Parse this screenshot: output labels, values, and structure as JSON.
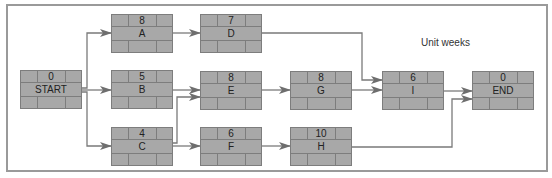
{
  "diagram": {
    "type": "activity-on-node network",
    "unit_label": "Unit weeks",
    "colors": {
      "node_fill": "#a8a8a8",
      "node_border": "#7d7d7d",
      "edge": "#7a7a7a",
      "frame": "#9a9a9a"
    },
    "nodes": [
      {
        "id": "START",
        "label": "START",
        "duration": "0",
        "x": 20,
        "y": 70
      },
      {
        "id": "A",
        "label": "A",
        "duration": "8",
        "x": 111,
        "y": 14
      },
      {
        "id": "B",
        "label": "B",
        "duration": "5",
        "x": 111,
        "y": 70
      },
      {
        "id": "C",
        "label": "C",
        "duration": "4",
        "x": 111,
        "y": 127
      },
      {
        "id": "D",
        "label": "D",
        "duration": "7",
        "x": 200,
        "y": 14
      },
      {
        "id": "E",
        "label": "E",
        "duration": "8",
        "x": 200,
        "y": 71
      },
      {
        "id": "F",
        "label": "F",
        "duration": "6",
        "x": 200,
        "y": 127
      },
      {
        "id": "G",
        "label": "G",
        "duration": "8",
        "x": 290,
        "y": 71
      },
      {
        "id": "H",
        "label": "H",
        "duration": "10",
        "x": 290,
        "y": 127
      },
      {
        "id": "I",
        "label": "I",
        "duration": "6",
        "x": 382,
        "y": 71
      },
      {
        "id": "END",
        "label": "END",
        "duration": "0",
        "x": 472,
        "y": 71
      }
    ],
    "edges": [
      {
        "from": "START",
        "to": "A",
        "points": "82,88 87,88 87,33 111,33"
      },
      {
        "from": "START",
        "to": "B",
        "points": "82,90 111,90"
      },
      {
        "from": "START",
        "to": "C",
        "points": "82,92 87,92 87,146 111,146"
      },
      {
        "from": "A",
        "to": "D",
        "points": "173,33 200,33"
      },
      {
        "from": "B",
        "to": "E",
        "points": "173,90 200,90"
      },
      {
        "from": "C",
        "to": "E",
        "points": "173,143 177,143 177,97 200,97"
      },
      {
        "from": "C",
        "to": "F",
        "points": "173,146 200,146"
      },
      {
        "from": "D",
        "to": "I",
        "points": "262,33 362,33 362,80 382,80"
      },
      {
        "from": "E",
        "to": "G",
        "points": "262,90 290,90"
      },
      {
        "from": "F",
        "to": "H",
        "points": "262,146 290,146"
      },
      {
        "from": "G",
        "to": "I",
        "points": "352,90 382,90"
      },
      {
        "from": "I",
        "to": "END",
        "points": "444,91 472,91"
      },
      {
        "from": "H",
        "to": "END",
        "points": "352,147 452,147 452,99 472,99"
      }
    ]
  }
}
